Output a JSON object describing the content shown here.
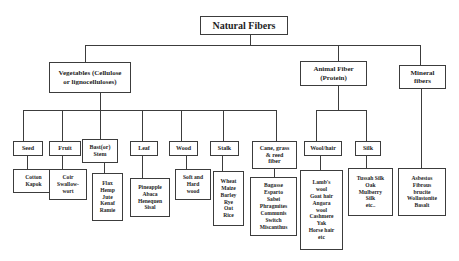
{
  "diagram": {
    "title": "Natural Fibers",
    "categories": [
      {
        "label_lines": [
          "Vegetables (Cellulose",
          "or lignocelluloses)"
        ],
        "subcategories": [
          {
            "label_lines": [
              "Seed"
            ],
            "examples": [
              "Cotton",
              "Kapok"
            ]
          },
          {
            "label_lines": [
              "Fruit"
            ],
            "examples": [
              "Coir",
              "Swallow-",
              "wort"
            ]
          },
          {
            "label_lines": [
              "Bast(or)",
              "Stem"
            ],
            "examples": [
              "Flax",
              "Hemp",
              "Jute",
              "Kenaf",
              "Ramie"
            ]
          },
          {
            "label_lines": [
              "Leaf"
            ],
            "examples": [
              "Pineapple",
              "Abaca",
              "Henequen",
              "Sisal"
            ]
          },
          {
            "label_lines": [
              "Wood"
            ],
            "examples": [
              "Soft and",
              "Hard",
              "wood"
            ]
          },
          {
            "label_lines": [
              "Stalk"
            ],
            "examples": [
              "Wheat",
              "Maize",
              "Barley",
              "Rye",
              "Oat",
              "Rice"
            ]
          },
          {
            "label_lines": [
              "Cane, grass",
              "& reed",
              "fiber"
            ],
            "examples": [
              "Bagasse",
              "Esparto",
              "Sabei",
              "Phragmites",
              "Communis",
              "Switch",
              "Miscanthus"
            ]
          }
        ]
      },
      {
        "label_lines": [
          "Animal Fiber",
          "(Protein)"
        ],
        "subcategories": [
          {
            "label_lines": [
              "Wool/hair"
            ],
            "examples": [
              "Lamb's",
              "wool",
              "Goat hair",
              "Angora",
              "wool",
              "Cashmere",
              "Yak",
              "Horse hair",
              "etc"
            ]
          },
          {
            "label_lines": [
              "Silk"
            ],
            "examples": [
              "Tussah Silk",
              "Oak",
              "Mulberry",
              "Silk",
              "etc.."
            ]
          }
        ]
      },
      {
        "label_lines": [
          "Mineral",
          "fibers"
        ],
        "examples": [
          "Asbestos",
          "Fibrous",
          "brucite",
          "Wollastonite",
          "Basalt"
        ]
      }
    ]
  }
}
